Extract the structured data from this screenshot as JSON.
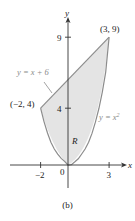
{
  "figure": {
    "caption": "(b)",
    "axes": {
      "x_label": "x",
      "y_label": "y",
      "x_ticks": [
        {
          "value": -2,
          "label": "−2"
        },
        {
          "value": 0,
          "label": "0"
        },
        {
          "value": 3,
          "label": "3"
        }
      ],
      "y_ticks": [
        {
          "value": 4,
          "label": "4"
        },
        {
          "value": 9,
          "label": "9"
        }
      ]
    },
    "curves": [
      {
        "name": "line",
        "equation": "y = x + 6"
      },
      {
        "name": "parabola",
        "equation": "y = x²"
      }
    ],
    "points": [
      {
        "label": "(3, 9)",
        "x": 3,
        "y": 9
      },
      {
        "label": "(−2, 4)",
        "x": -2,
        "y": 4
      }
    ],
    "region_label": "R",
    "colors": {
      "fill": "#e4e4e4",
      "curve": "#8c8c8c",
      "axis": "#333333",
      "label_gray": "#8a8a8a"
    }
  },
  "labels": {
    "line_eq_prefix": "y = x + 6",
    "parabola_eq_y": "y = x",
    "parabola_exp": "2",
    "pt_top": "(3, 9)",
    "pt_left": "(−2, 4)",
    "tick_x_neg2": "−2",
    "tick_x_0": "0",
    "tick_x_3": "3",
    "tick_y_4": "4",
    "tick_y_9": "9",
    "axis_x": "x",
    "axis_y": "y",
    "region": "R"
  }
}
